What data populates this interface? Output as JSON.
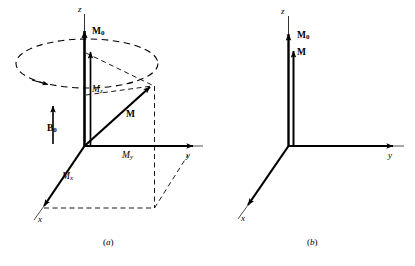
{
  "figure": {
    "background_color": "#ffffff",
    "line_color": "#000000",
    "panels": [
      {
        "id": "a",
        "caption": "(a)",
        "axes": {
          "z_label": "z",
          "y_label": "y",
          "x_label": "x"
        },
        "vectors": [
          {
            "name": "M0",
            "label_main": "M",
            "label_sub": "0"
          },
          {
            "name": "M",
            "label_main": "M",
            "label_sub": ""
          },
          {
            "name": "B0",
            "label_main": "B",
            "label_sub": "0"
          }
        ],
        "components": [
          {
            "name": "Mz",
            "label_main": "M",
            "label_sub": "z"
          },
          {
            "name": "My",
            "label_main": "M",
            "label_sub": "y"
          },
          {
            "name": "Mx",
            "label_main": "M",
            "label_sub": "x"
          }
        ],
        "precession_cone": "dashed ellipse",
        "projection_box": "dashed rectangle"
      },
      {
        "id": "b",
        "caption": "(b)",
        "axes": {
          "z_label": "z",
          "y_label": "y",
          "x_label": "x"
        },
        "vectors": [
          {
            "name": "M0",
            "label_main": "M",
            "label_sub": "0"
          },
          {
            "name": "M",
            "label_main": "M",
            "label_sub": ""
          }
        ]
      }
    ]
  },
  "panel_a": {
    "caption_open": "(",
    "caption_letter": "a",
    "caption_close": ")",
    "z_label": "z",
    "y_label": "y",
    "x_label": "x",
    "m0_main": "M",
    "m0_sub": "0",
    "m_label": "M",
    "b0_main": "B",
    "b0_sub": "0",
    "mz_main": "M",
    "mz_sub": "z",
    "my_main": "M",
    "my_sub": "y",
    "mx_main": "M",
    "mx_sub": "x"
  },
  "panel_b": {
    "caption_open": "(",
    "caption_letter": "b",
    "caption_close": ")",
    "z_label": "z",
    "y_label": "y",
    "x_label": "x",
    "m0_main": "M",
    "m0_sub": "0",
    "m_label": "M"
  }
}
